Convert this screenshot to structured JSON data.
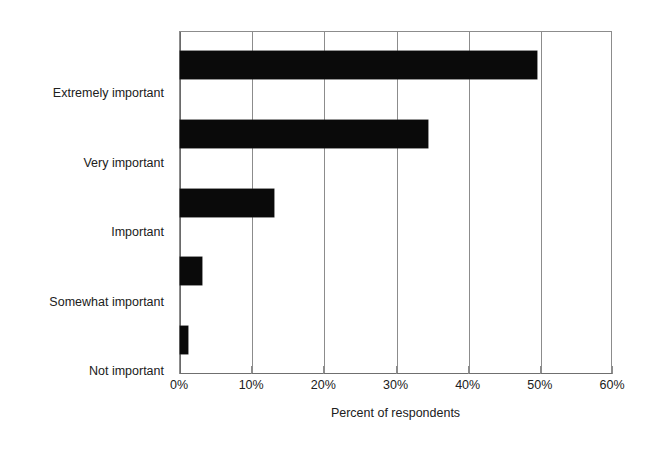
{
  "chart_data": {
    "type": "bar",
    "orientation": "horizontal",
    "title": "",
    "subtitle": "",
    "xlabel": "Percent of respondents",
    "ylabel": "",
    "categories": [
      "Extremely important",
      "Very important",
      "Important",
      "Somewhat important",
      "Not important"
    ],
    "values": [
      49.5,
      34.3,
      13.0,
      3.1,
      1.1
    ],
    "series": [
      {
        "name": "Percent of respondents",
        "values": [
          49.5,
          34.3,
          13.0,
          3.1,
          1.1
        ]
      }
    ],
    "xlim": [
      0,
      60
    ],
    "ylim": null,
    "xticks": [
      0,
      10,
      20,
      30,
      40,
      50,
      60
    ],
    "xtick_labels": [
      "0%",
      "10%",
      "20%",
      "30%",
      "40%",
      "50%",
      "60%"
    ],
    "grid": "vertical",
    "legend": "none",
    "bar_color": "#0a0a0a",
    "plot_border_color": "#8c8c8c",
    "background_color": "#ffffff",
    "annotations": []
  },
  "axis": {
    "x_title": "Percent of respondents",
    "tick_labels": [
      "0%",
      "10%",
      "20%",
      "30%",
      "40%",
      "50%",
      "60%"
    ]
  },
  "categories": [
    {
      "label": "Extremely important",
      "value": 49.5
    },
    {
      "label": "Very important",
      "value": 34.3
    },
    {
      "label": "Important",
      "value": 13.0
    },
    {
      "label": "Somewhat important",
      "value": 3.1
    },
    {
      "label": "Not important",
      "value": 1.1
    }
  ]
}
